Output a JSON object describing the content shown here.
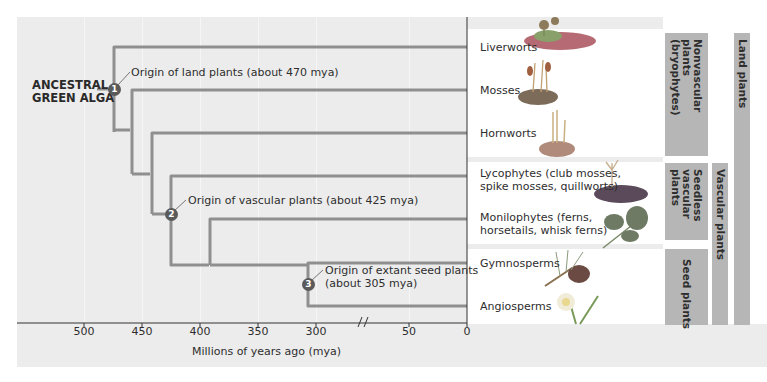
{
  "figure": {
    "root_label": "ANCESTRAL\nGREEN ALGA",
    "root_label_lines": [
      "ANCESTRAL",
      "GREEN ALGA"
    ],
    "events": [
      {
        "number": "1",
        "text": "Origin of land plants (about 470 mya)"
      },
      {
        "number": "2",
        "text": "Origin of vascular plants (about 425 mya)"
      },
      {
        "number": "3",
        "text_lines": [
          "Origin of extant seed plants",
          "(about 305 mya)"
        ]
      }
    ],
    "taxa": [
      {
        "name": "Liverworts",
        "icon": "liverwort-illustration"
      },
      {
        "name": "Mosses",
        "icon": "moss-illustration"
      },
      {
        "name": "Hornworts",
        "icon": "hornwort-illustration"
      },
      {
        "name_lines": [
          "Lycophytes (club mosses,",
          "spike mosses, quillworts)"
        ],
        "icon": "lycophyte-illustration"
      },
      {
        "name_lines": [
          "Monilophytes (ferns,",
          "horsetails, whisk ferns)"
        ],
        "icon": "fern-illustration"
      },
      {
        "name": "Gymnosperms",
        "icon": "pine-cone-illustration"
      },
      {
        "name": "Angiosperms",
        "icon": "daffodil-illustration"
      }
    ],
    "groups": {
      "nonvascular": "Nonvascular\nplants\n(bryophytes)",
      "seedless_vascular": "Seedless\nvascular\nplants",
      "seed": "Seed plants",
      "vascular": "Vascular plants",
      "land": "Land plants"
    },
    "axis": {
      "title": "Millions of years ago (mya)",
      "ticks": [
        "500",
        "450",
        "400",
        "350",
        "300",
        "50",
        "0"
      ],
      "break_symbol": "//"
    },
    "colors": {
      "branch": "#8f8f8f",
      "node": "#5a5a5a",
      "group_bar": "#b6b6b6",
      "panel": "#ececec"
    }
  }
}
